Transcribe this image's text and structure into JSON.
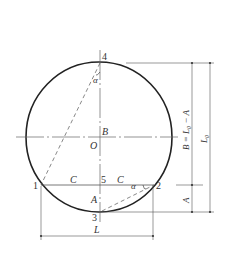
{
  "diagram": {
    "colors": {
      "stroke": "#222222",
      "thin": "#555555",
      "text": "#333333",
      "background": "#ffffff"
    },
    "points": {
      "p1": "1",
      "p2": "2",
      "p3": "3",
      "p4": "4",
      "p5": "5"
    },
    "labels": {
      "center": "O",
      "B": "B",
      "A": "A",
      "C_left": "C",
      "C_right": "C",
      "alpha_top": "α",
      "alpha_right": "α"
    },
    "dimensions": {
      "chord_length": "L",
      "right_inner": "B = L₀ − A",
      "right_outer": "L₀",
      "right_lower": "A"
    }
  }
}
